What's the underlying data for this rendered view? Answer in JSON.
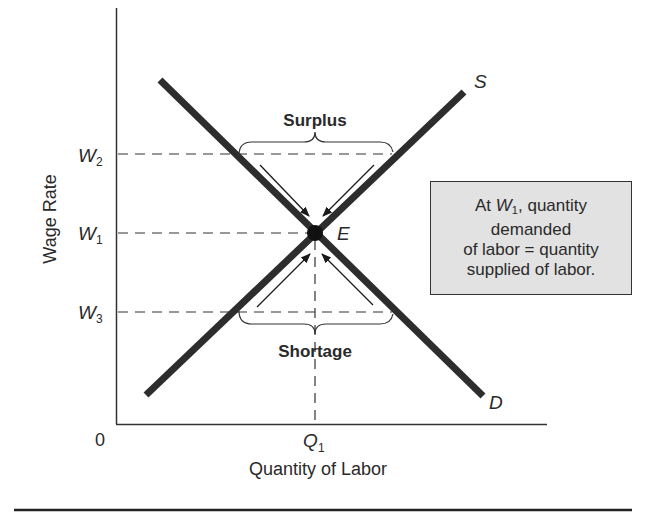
{
  "diagram": {
    "type": "labor-market-supply-demand",
    "y_axis_label": "Wage Rate",
    "x_axis_label": "Quantity of Labor",
    "origin_label": "0",
    "y_ticks": [
      {
        "base": "W",
        "sub": "2"
      },
      {
        "base": "W",
        "sub": "1"
      },
      {
        "base": "W",
        "sub": "3"
      }
    ],
    "x_ticks": [
      {
        "base": "Q",
        "sub": "1"
      }
    ],
    "curves": {
      "supply_label": "S",
      "demand_label": "D"
    },
    "equilibrium_label": "E",
    "surplus_label": "Surplus",
    "shortage_label": "Shortage",
    "info_box": {
      "line1_prefix": "At ",
      "line1_var": "W",
      "line1_sub": "1",
      "line1_suffix": ", quantity",
      "line2": "demanded",
      "line3": "of labor = quantity",
      "line4": "supplied of labor."
    },
    "colors": {
      "curve": "#2d2d2d",
      "box_fill": "#e2e2e2",
      "text": "#2a2a2a"
    }
  }
}
